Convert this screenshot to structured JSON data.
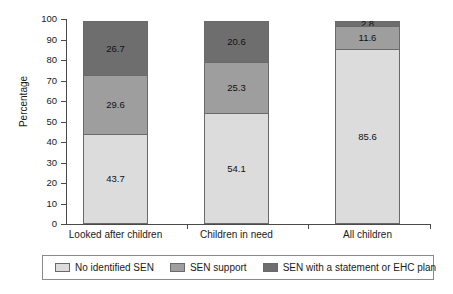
{
  "chart_data": {
    "type": "bar",
    "subtype": "stacked-percentage",
    "title": "",
    "xlabel": "",
    "ylabel": "Percentage",
    "ylim": [
      0,
      100
    ],
    "yticks": [
      0,
      10,
      20,
      30,
      40,
      50,
      60,
      70,
      80,
      90,
      100
    ],
    "ytick_labels": [
      "0",
      "10",
      "20",
      "30",
      "40",
      "50",
      "60",
      "70",
      "80",
      "90",
      "100"
    ],
    "grid": false,
    "legend_position": "bottom",
    "categories": [
      "Looked after children",
      "Children in need",
      "All children"
    ],
    "series": [
      {
        "name": "No identified SEN",
        "color": "#dcdcdc",
        "values": [
          43.7,
          54.1,
          85.6
        ],
        "value_labels": [
          "43.7",
          "54.1",
          "85.6"
        ]
      },
      {
        "name": "SEN support",
        "color": "#9e9e9e",
        "values": [
          29.6,
          25.3,
          11.6
        ],
        "value_labels": [
          "29.6",
          "25.3",
          "11.6"
        ]
      },
      {
        "name": "SEN with a statement or EHC plan",
        "color": "#6e6e6e",
        "values": [
          26.7,
          20.6,
          2.8
        ],
        "value_labels": [
          "26.7",
          "20.6",
          "2.8"
        ]
      }
    ]
  },
  "axis": {
    "y_title": "Percentage"
  },
  "colors": {
    "no_identified_sen": "#dcdcdc",
    "sen_support": "#9e9e9e",
    "sen_statement": "#6e6e6e",
    "axis": "#4a4a4a",
    "bar_border": "#6a6a6a",
    "legend_border": "#8a8a8a",
    "text": "#1a1a1a",
    "background": "#ffffff"
  }
}
